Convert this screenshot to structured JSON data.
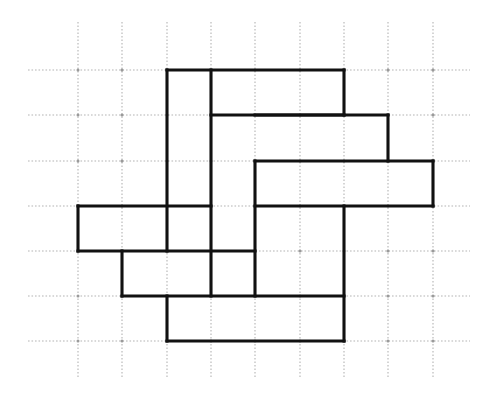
{
  "figure": {
    "background_color": "#ffffff",
    "line_color": "#111111",
    "grid_color": "#b3b3b3",
    "line_width_px": 3.1,
    "grid_line_width_px": 1.1
  },
  "grid": {
    "origin_x": 78,
    "origin_y": 70,
    "cell_width": 44.3,
    "cell_height": 45.2,
    "columns": 8,
    "rows": 6,
    "vertical_x": [
      78,
      122,
      167,
      211,
      255,
      300,
      344,
      388,
      433
    ],
    "horizontal_y": [
      70,
      115,
      161,
      206,
      251,
      296,
      341
    ],
    "vertical_extent_y": [
      22,
      378
    ],
    "horizontal_extent_x": [
      28,
      470
    ],
    "style": "dotted"
  },
  "chart_data": {
    "type": "diagram",
    "xlabel": "",
    "ylabel": "",
    "grid": true,
    "legend": "none",
    "units": "grid cells",
    "tiles": [
      {
        "id": 1,
        "orientation": "vertical",
        "col": 2,
        "row": 0,
        "w": 1,
        "h": 3
      },
      {
        "id": 2,
        "orientation": "horizontal",
        "col": 3,
        "row": 0,
        "w": 3,
        "h": 1
      },
      {
        "id": 3,
        "orientation": "vertical",
        "col": 3,
        "row": 0,
        "w": 1,
        "h": 4
      },
      {
        "id": 4,
        "orientation": "horizontal",
        "col": 4,
        "row": 1,
        "w": 3,
        "h": 1
      },
      {
        "id": 5,
        "orientation": "horizontal",
        "col": 4,
        "row": 2,
        "w": 4,
        "h": 1
      },
      {
        "id": 6,
        "orientation": "vertical",
        "col": 4,
        "row": 2,
        "w": 1,
        "h": 3
      },
      {
        "id": 7,
        "orientation": "horizontal",
        "col": 0,
        "row": 3,
        "w": 3,
        "h": 1
      },
      {
        "id": 8,
        "orientation": "horizontal",
        "col": 1,
        "row": 4,
        "w": 3,
        "h": 1
      },
      {
        "id": 9,
        "orientation": "vertical",
        "col": 6,
        "row": 3,
        "w": 1,
        "h": 3
      },
      {
        "id": 10,
        "orientation": "horizontal",
        "col": 2,
        "row": 5,
        "w": 4,
        "h": 1
      }
    ],
    "segments_horizontal": [
      {
        "col_start": 2,
        "col_end": 6,
        "row": 0
      },
      {
        "col_start": 3,
        "col_end": 6,
        "row": 1
      },
      {
        "col_start": 4,
        "col_end": 7,
        "row": 1
      },
      {
        "col_start": 4,
        "col_end": 8,
        "row": 2
      },
      {
        "col_start": 0,
        "col_end": 3,
        "row": 3
      },
      {
        "col_start": 4,
        "col_end": 8,
        "row": 3
      },
      {
        "col_start": 0,
        "col_end": 4,
        "row": 4
      },
      {
        "col_start": 1,
        "col_end": 6,
        "row": 5
      },
      {
        "col_start": 2,
        "col_end": 6,
        "row": 6
      }
    ],
    "segments_vertical": [
      {
        "col": 2,
        "row_start": 0,
        "row_end": 4
      },
      {
        "col": 3,
        "row_start": 0,
        "row_end": 5
      },
      {
        "col": 6,
        "row_start": 0,
        "row_end": 1
      },
      {
        "col": 7,
        "row_start": 1,
        "row_end": 2
      },
      {
        "col": 8,
        "row_start": 2,
        "row_end": 3
      },
      {
        "col": 4,
        "row_start": 2,
        "row_end": 5
      },
      {
        "col": 0,
        "row_start": 3,
        "row_end": 4
      },
      {
        "col": 1,
        "row_start": 4,
        "row_end": 5
      },
      {
        "col": 6,
        "row_start": 3,
        "row_end": 6
      },
      {
        "col": 2,
        "row_start": 5,
        "row_end": 6
      }
    ]
  }
}
